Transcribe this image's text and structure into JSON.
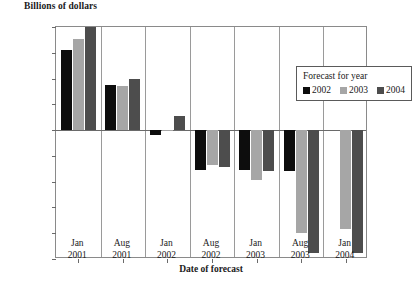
{
  "chart_data": {
    "type": "bar",
    "title": "",
    "ylabel": "Billions of dollars",
    "xlabel": "Date of forecast",
    "ylim": [
      -500,
      400
    ],
    "yticks": [
      400,
      300,
      200,
      100,
      0,
      -100,
      -200,
      -300,
      -400,
      -500
    ],
    "ytick_labels": [
      "400",
      "300",
      "200",
      "100",
      "0",
      "−100",
      "−200",
      "−300",
      "−400",
      "−500"
    ],
    "grid": false,
    "categories": [
      {
        "month": "Jan",
        "year": "2001"
      },
      {
        "month": "Aug",
        "year": "2001"
      },
      {
        "month": "Jan",
        "year": "2002"
      },
      {
        "month": "Aug",
        "year": "2002"
      },
      {
        "month": "Jan",
        "year": "2003"
      },
      {
        "month": "Aug",
        "year": "2003"
      },
      {
        "month": "Jan",
        "year": "2004"
      }
    ],
    "legend": {
      "title": "Forecast for year",
      "position": "top-right-inside",
      "entries": [
        {
          "label": "2002",
          "color": "#0d0d0d"
        },
        {
          "label": "2003",
          "color": "#a6a6a6"
        },
        {
          "label": "2004",
          "color": "#4d4d4d"
        }
      ]
    },
    "series": [
      {
        "name": "2002",
        "color": "#0d0d0d",
        "values": [
          310,
          175,
          -20,
          -155,
          -155,
          -160,
          null
        ]
      },
      {
        "name": "2003",
        "color": "#a6a6a6",
        "values": [
          355,
          170,
          -5,
          -135,
          -195,
          -400,
          -385
        ]
      },
      {
        "name": "2004",
        "color": "#4d4d4d",
        "values": [
          400,
          200,
          55,
          -145,
          -160,
          -475,
          -475
        ]
      }
    ]
  }
}
